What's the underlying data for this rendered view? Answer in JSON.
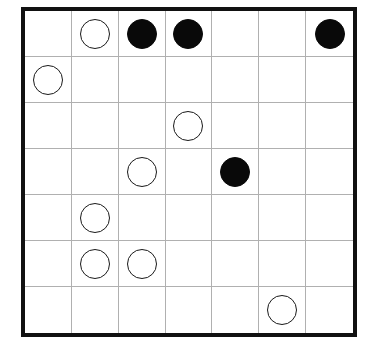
{
  "puzzle": {
    "type": "masyu-grid",
    "rows": 7,
    "cols": 7,
    "colors": {
      "board_border": "#111111",
      "grid_line": "#b0b0b0",
      "background": "#ffffff",
      "white_stone_fill": "#ffffff",
      "white_stone_stroke": "#1a1a1a",
      "black_stone_fill": "#090909"
    },
    "legend": {
      "empty": "empty-cell",
      "white": "white-circle",
      "black": "black-circle"
    },
    "cells": [
      [
        "empty",
        "white",
        "black",
        "black",
        "empty",
        "empty",
        "black"
      ],
      [
        "white",
        "empty",
        "empty",
        "empty",
        "empty",
        "empty",
        "empty"
      ],
      [
        "empty",
        "empty",
        "empty",
        "white",
        "empty",
        "empty",
        "empty"
      ],
      [
        "empty",
        "empty",
        "white",
        "empty",
        "black",
        "empty",
        "empty"
      ],
      [
        "empty",
        "white",
        "empty",
        "empty",
        "empty",
        "empty",
        "empty"
      ],
      [
        "empty",
        "white",
        "white",
        "empty",
        "empty",
        "empty",
        "empty"
      ],
      [
        "empty",
        "empty",
        "empty",
        "empty",
        "empty",
        "white",
        "empty"
      ]
    ],
    "counts": {
      "white_circles": 8,
      "black_circles": 4,
      "empty_cells": 37
    }
  }
}
